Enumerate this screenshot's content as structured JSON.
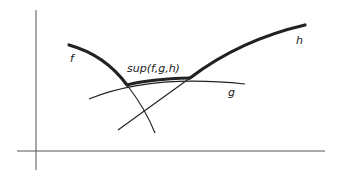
{
  "diagram": {
    "labels": {
      "f": "f",
      "g": "g",
      "h": "h",
      "sup": "sup(f,g,h)"
    },
    "colors": {
      "ink": "#222222",
      "axis": "#555555",
      "background": "#ffffff"
    }
  }
}
